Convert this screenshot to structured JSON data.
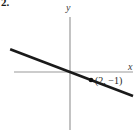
{
  "figure": {
    "problem_number": "2.",
    "background_color": "#ffffff",
    "width": 139,
    "height": 130
  },
  "axes": {
    "x_label": "x",
    "y_label": "y",
    "axis_color": "#9a9a9a",
    "origin_x": 70,
    "origin_y": 72,
    "x_axis_start": 14,
    "x_axis_end": 133,
    "y_axis_start": 17,
    "y_axis_end": 130
  },
  "annotations": {
    "point_label": "(2, −1)",
    "point_marker_color": "#111111"
  },
  "chart_data": {
    "type": "line",
    "title": "",
    "xlabel": "x",
    "ylabel": "y",
    "grid": false,
    "legend": false,
    "xlim": [
      -6,
      6
    ],
    "ylim": [
      -5,
      5
    ],
    "series": [
      {
        "name": "line through origin",
        "slope": -0.5,
        "intercept": 0,
        "color": "#1a1a1a",
        "x": [
          -5.7,
          6.0
        ],
        "y": [
          2.85,
          -3.0
        ]
      }
    ],
    "points": [
      {
        "label": "(2, −1)",
        "x": 2,
        "y": -1,
        "marker": "filled-circle",
        "color": "#111111"
      }
    ]
  }
}
